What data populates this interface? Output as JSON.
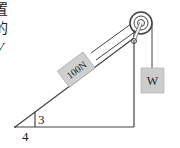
{
  "figure": {
    "type": "inclined-plane-pulley",
    "cropped_text_fragments": [
      "置",
      "的",
      "V"
    ],
    "block_label": "100N",
    "hanging_weight_label": "W",
    "incline_ratio": {
      "rise_label": "3",
      "run_label": "4"
    },
    "colors": {
      "line": "#444444",
      "block_fill": "#cfcfcf",
      "weight_fill": "#cccccc",
      "text": "#222222"
    }
  }
}
